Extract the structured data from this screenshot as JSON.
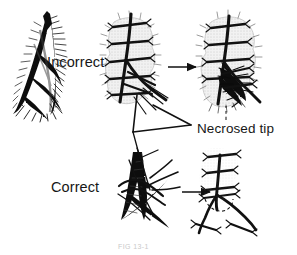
{
  "figure": {
    "domain": "medical-surgical-illustration",
    "background_color": "#ffffff",
    "ink_color": "#111111",
    "caption": "FIG 13-1",
    "labels": {
      "incorrect": "Incorrect",
      "correct": "Correct",
      "necrosed_tip": "Necrosed tip"
    },
    "panels": [
      {
        "id": "panel-wound-flap",
        "row": "incorrect",
        "description": "V-shaped pointed skin flap wound, hatched shading"
      },
      {
        "id": "panel-incorrect-suture",
        "row": "incorrect",
        "description": "Flap closed with simple interrupted sutures across the tip"
      },
      {
        "id": "panel-incorrect-result",
        "row": "incorrect",
        "description": "Healed result showing blackened necrosed flap tip"
      },
      {
        "id": "panel-correct-suture",
        "row": "correct",
        "description": "Flap closed with a half-buried horizontal mattress corner stitch"
      },
      {
        "id": "panel-correct-result",
        "row": "correct",
        "description": "Healed result with viable flap tip and no necrosis"
      }
    ],
    "arrows": [
      {
        "id": "arrow-incorrect",
        "from": "panel-incorrect-suture",
        "to": "panel-incorrect-result"
      },
      {
        "id": "arrow-correct",
        "from": "panel-correct-suture",
        "to": "panel-correct-result"
      }
    ],
    "leaders": [
      {
        "id": "leader-necrosed-tip",
        "style": "dashed",
        "points_to": "panel-incorrect-result"
      }
    ],
    "pointer": {
      "id": "pointer-corner-stitch",
      "style": "triangular-bracket",
      "description": "Triangular bracket linking incorrect corner stitch detail to correct technique"
    }
  }
}
